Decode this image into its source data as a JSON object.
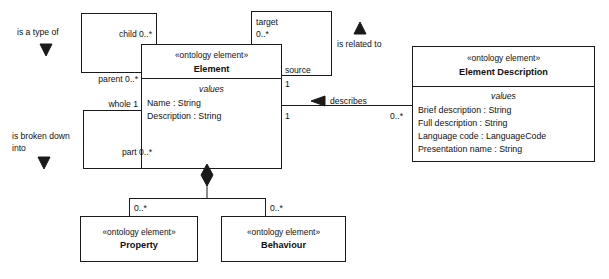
{
  "diagram": {
    "kind": "uml-class-diagram",
    "background_color": "#ffffff",
    "line_color": "#1a1a1a",
    "text_color": "#111111",
    "caption": ""
  },
  "classes": {
    "element": {
      "stereotype": "«ontology element»",
      "name": "Element",
      "compartment_title": "values",
      "attributes": [
        "Name : String",
        "Description : String"
      ]
    },
    "element_description": {
      "stereotype": "«ontology element»",
      "name": "Element Description",
      "compartment_title": "values",
      "attributes": [
        "Brief description : String",
        "Full description : String",
        "Language code : LanguageCode",
        "Presentation name : String"
      ]
    },
    "property": {
      "stereotype": "«ontology element»",
      "name": "Property"
    },
    "behaviour": {
      "stereotype": "«ontology element»",
      "name": "Behaviour"
    }
  },
  "roles": {
    "child": "child 0..*",
    "parent": "parent 0..*",
    "whole": "whole 1",
    "part": "part 0..*",
    "target": "target",
    "target_mult": "0..*",
    "source": "source",
    "source_mult_top": "1",
    "source_mult_bottom": "1",
    "describes_mult": "0..*",
    "property_mult": "0..*",
    "behaviour_mult": "0..*"
  },
  "annotations": {
    "is_a_type_of": "is a type of",
    "is_broken_down_line1": "is broken down",
    "is_broken_down_line2": "into",
    "is_related_to": "is related to",
    "describes": "describes"
  },
  "icons": {
    "down_arrow_type_of": "triangle-down-icon",
    "down_arrow_broken_down": "triangle-down-icon",
    "up_arrow_related_to": "triangle-up-icon",
    "left_arrow_describes": "triangle-left-icon",
    "composition_diamond": "filled-diamond-icon"
  }
}
